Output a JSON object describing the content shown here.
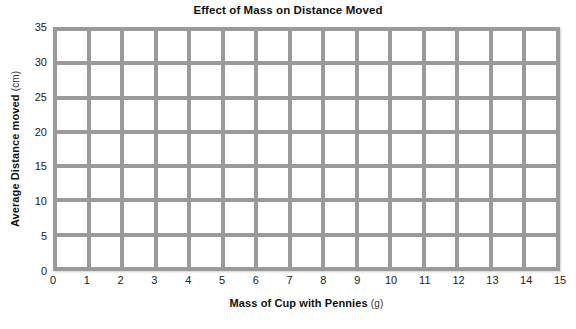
{
  "chart_data": {
    "type": "line",
    "title": "Effect of Mass on Distance Moved",
    "subtitle": "",
    "xlabel": "Mass of Cup with Pennies",
    "xunit": "(g)",
    "ylabel": "Average Distance moved",
    "yunit": "(cm)",
    "x_ticks": [
      "0",
      "1",
      "2",
      "3",
      "4",
      "5",
      "6",
      "7",
      "8",
      "9",
      "10",
      "11",
      "12",
      "13",
      "14",
      "15"
    ],
    "y_ticks": [
      "0",
      "5",
      "10",
      "15",
      "20",
      "25",
      "30",
      "35"
    ],
    "xlim": [
      0,
      15
    ],
    "ylim": [
      0,
      35
    ],
    "x_tick_step": 1,
    "y_tick_step": 5,
    "grid": true,
    "grid_columns": 15,
    "grid_rows": 7,
    "legend": null,
    "series": [],
    "values": [],
    "x": [],
    "categories": [],
    "annotations": [],
    "note": "Blank grid template with no plotted data points",
    "colors": {
      "grid_line": "#9a9a9a",
      "cell_fill": "#ffffff",
      "text": "#111111",
      "background": "#ffffff"
    }
  }
}
